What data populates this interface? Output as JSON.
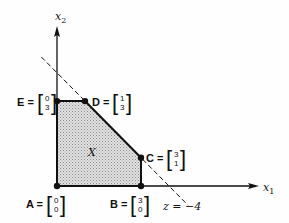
{
  "diagram": {
    "axes": {
      "x_label": "x",
      "x_sub": "1",
      "y_label": "x",
      "y_sub": "2"
    },
    "region_label": "X",
    "region_fill": "#d0d0d0",
    "vertices": [
      {
        "name": "A",
        "x1": 0,
        "x2": 0,
        "top": "0",
        "bottom": "0"
      },
      {
        "name": "B",
        "x1": 3,
        "x2": 0,
        "top": "3",
        "bottom": "0"
      },
      {
        "name": "C",
        "x1": 3,
        "x2": 1,
        "top": "3",
        "bottom": "1"
      },
      {
        "name": "D",
        "x1": 1,
        "x2": 3,
        "top": "1",
        "bottom": "3"
      },
      {
        "name": "E",
        "x1": 0,
        "x2": 3,
        "top": "0",
        "bottom": "3"
      }
    ],
    "objective_line": {
      "label": "z = −4",
      "through": [
        [
          4,
          0
        ],
        [
          0,
          4
        ]
      ],
      "style": "dashed"
    }
  }
}
